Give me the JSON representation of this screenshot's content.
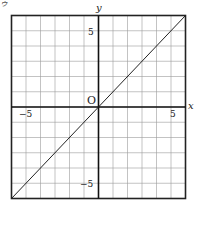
{
  "chart_data": {
    "type": "line",
    "title": "",
    "xlabel": "x",
    "ylabel": "y",
    "origin_label": "O",
    "xlim": [
      -6,
      6
    ],
    "ylim": [
      -6,
      6
    ],
    "grid": true,
    "grid_step": 1,
    "x_ticks_labeled": [
      -5,
      5
    ],
    "y_ticks_labeled": [
      5,
      -5
    ],
    "tick_labels": {
      "x_neg": "−5",
      "x_pos": "5",
      "y_pos": "5",
      "y_neg": "−5"
    },
    "series": [
      {
        "name": "y = x",
        "x": [
          -6,
          6
        ],
        "y": [
          -6,
          6
        ]
      }
    ],
    "legend": null
  },
  "corner_marks": {
    "top_left": "ゥ"
  }
}
